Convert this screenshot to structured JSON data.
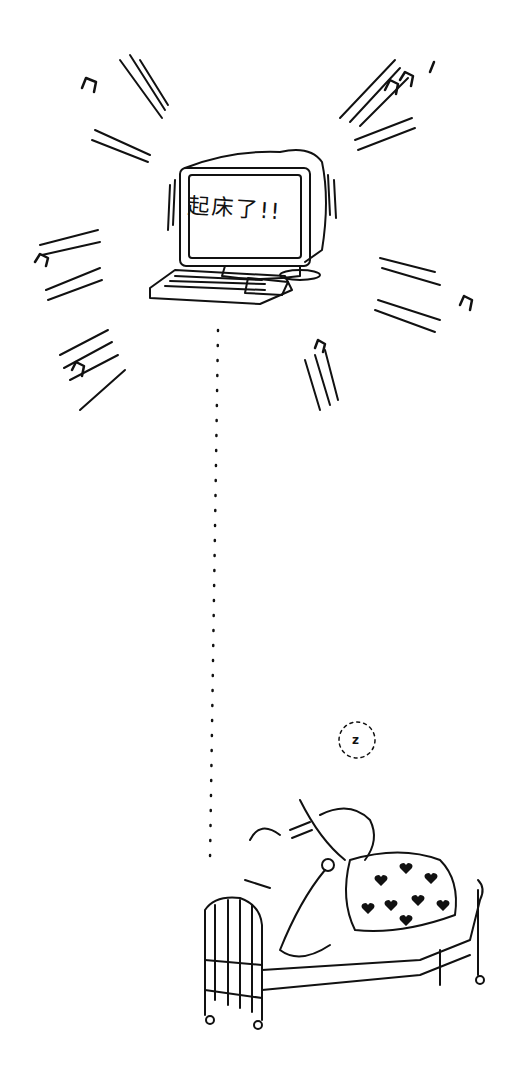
{
  "illustration": {
    "style": "black-and-white line-art cartoon",
    "computer": {
      "screen_text": "起床了!!",
      "alarm_notes": "music-note"
    },
    "sleeper": {
      "snore_text": "z",
      "blanket_pattern": "hearts"
    },
    "colors": {
      "ink": "#111111",
      "paper": "#ffffff"
    }
  }
}
